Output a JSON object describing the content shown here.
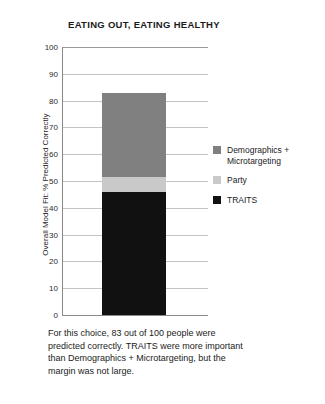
{
  "chart_data": {
    "type": "bar",
    "stacked": true,
    "title": "EATING OUT, EATING HEALTHY",
    "xlabel": "",
    "ylabel": "Overall Model Fit: % Predicted Correctly",
    "ylim": [
      0,
      100
    ],
    "yticks": [
      100,
      90,
      80,
      70,
      60,
      50,
      40,
      30,
      20,
      10,
      0
    ],
    "grid": true,
    "legend_position": "right",
    "categories": [
      "Eating out, eating healthy"
    ],
    "total": 83,
    "series": [
      {
        "name": "Demographics + Microtargeting",
        "values": [
          31.4
        ],
        "color": "#808080"
      },
      {
        "name": "Party",
        "values": [
          5.6
        ],
        "color": "#c9c9c9"
      },
      {
        "name": "TRAITS",
        "values": [
          46.0
        ],
        "color": "#111111"
      }
    ],
    "stack_order_bottom_to_top": [
      "TRAITS",
      "Party",
      "Demographics + Microtargeting"
    ],
    "annotation": "For this choice, 83 out of 100 people were predicted correctly. TRAITS were more important than Demographics + Microtargeting, but the margin was not large."
  },
  "legend": {
    "items": [
      {
        "label": "Demographics + Microtargeting",
        "color": "#808080"
      },
      {
        "label": "Party",
        "color": "#c9c9c9"
      },
      {
        "label": "TRAITS",
        "color": "#111111"
      }
    ]
  },
  "caption": {
    "text": "For this choice, 83 out of 100 people were predicted correctly. TRAITS were more important than Demographics + Microtargeting, but the margin was not large."
  }
}
